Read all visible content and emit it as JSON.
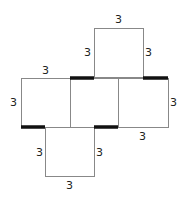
{
  "diagram": {
    "type": "cube-net",
    "squares": [
      {
        "id": "top",
        "x": 94,
        "y": 28,
        "size": 49
      },
      {
        "id": "left",
        "x": 21,
        "y": 78,
        "size": 49
      },
      {
        "id": "middle",
        "x": 70,
        "y": 78,
        "size": 48
      },
      {
        "id": "right",
        "x": 118,
        "y": 78,
        "size": 51
      },
      {
        "id": "bottom",
        "x": 45,
        "y": 127,
        "size": 49
      }
    ],
    "thick_edges": [
      {
        "x1": 70,
        "y1": 78,
        "x2": 94,
        "y2": 78
      },
      {
        "x1": 143,
        "y1": 78,
        "x2": 168,
        "y2": 78
      },
      {
        "x1": 21,
        "y1": 127,
        "x2": 45,
        "y2": 127
      },
      {
        "x1": 94,
        "y1": 127,
        "x2": 118,
        "y2": 127
      }
    ],
    "labels": {
      "top_top": "3",
      "top_left": "3",
      "top_right": "3",
      "left_top": "3",
      "left_left": "3",
      "right_right": "3",
      "right_bottom": "3",
      "bottom_left": "3",
      "bottom_right": "3",
      "bottom_bottom": "3"
    },
    "colors": {
      "edge": "#888888",
      "thick_edge": "#111111",
      "text": "#222222"
    }
  }
}
